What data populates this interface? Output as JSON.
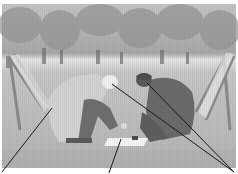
{
  "figure": {
    "kind": "annotated-photograph",
    "photo_bounds": {
      "x": 2,
      "y": 4,
      "width": 234,
      "height": 164
    },
    "colors": {
      "sky": "#c8c8c8",
      "trees": "#8f8f8f",
      "grass": "#b8b8b8",
      "figure_dark": "#6a6a6a",
      "coat_light": "#cfcfcf",
      "leader_line": "#1a1a1a"
    },
    "annotations": [
      {
        "id": "deckchair-left-coat",
        "from": [
          52,
          108
        ],
        "to": [
          2,
          172
        ]
      },
      {
        "id": "picnic-cloth",
        "from": [
          121,
          139
        ],
        "to": [
          109,
          173
        ]
      },
      {
        "id": "person-left-head",
        "from": [
          112,
          84
        ],
        "to": [
          234,
          172
        ]
      },
      {
        "id": "person-right-head",
        "from": [
          147,
          83
        ],
        "to": [
          234,
          172
        ]
      }
    ]
  }
}
